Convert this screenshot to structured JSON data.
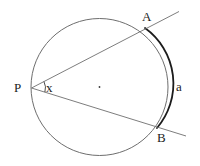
{
  "figure": {
    "width": 200,
    "height": 166,
    "background_color": "#ffffff",
    "stroke_color": "#6e6e6e",
    "emphasis_stroke_color": "#1c1c1c",
    "label_color": "#1c1c1c"
  },
  "labels": {
    "vertex_P": "P",
    "point_A": "A",
    "point_B": "B",
    "angle_x": "x",
    "arc_a": "a"
  },
  "geometry": {
    "circle": {
      "center_x": 99.5,
      "center_y": 87,
      "radius": 68.5,
      "stroke_width": 1
    },
    "center_dot": {
      "x": 99.5,
      "y": 87,
      "r": 0.9
    },
    "points": {
      "P": {
        "x": 31.5,
        "y": 88
      },
      "A": {
        "x": 145,
        "y": 28
      },
      "B": {
        "x": 157,
        "y": 128
      }
    },
    "secant_PA": {
      "x1": 31.5,
      "y1": 88,
      "x2": 179,
      "y2": 11.5
    },
    "secant_PB": {
      "x1": 31.5,
      "y1": 88,
      "x2": 186,
      "y2": 136
    },
    "angle_arc": {
      "cx": 31.5,
      "cy": 88,
      "radius": 14,
      "start_angle_deg": -27,
      "end_angle_deg": 17
    },
    "highlighted_arc": {
      "from": "A",
      "to": "B",
      "side": "right",
      "stroke_width": 1.8
    }
  },
  "annotations": {
    "inscribed_angle_label": "x",
    "intercepted_arc_label": "a"
  }
}
